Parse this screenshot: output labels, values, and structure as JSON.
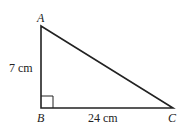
{
  "diagram": {
    "type": "right-triangle",
    "vertices": [
      {
        "name": "A",
        "x": 41,
        "y": 26
      },
      {
        "name": "B",
        "x": 41,
        "y": 108
      },
      {
        "name": "C",
        "x": 173,
        "y": 108
      }
    ],
    "right_angle_at": "B",
    "sides": [
      {
        "from": "A",
        "to": "B",
        "label": "7 cm"
      },
      {
        "from": "B",
        "to": "C",
        "label": "24 cm"
      }
    ],
    "stroke_color": "#222222"
  },
  "labels": {
    "A": "A",
    "B": "B",
    "C": "C",
    "AB": "7 cm",
    "BC": "24 cm"
  }
}
